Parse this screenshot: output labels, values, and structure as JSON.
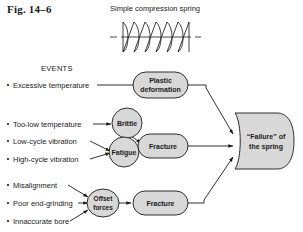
{
  "figure": {
    "number_label": "Fig. 14–6",
    "spring_title": "Simple compression spring",
    "events_heading": "EVENTS"
  },
  "colors": {
    "shape_fill": "#d8d8d8",
    "stroke": "#1a1a1a",
    "background": "#ffffff"
  },
  "events": [
    {
      "label": "Excessive temperature"
    },
    {
      "label": "Too-low temperature"
    },
    {
      "label": "Low-cycle vibration"
    },
    {
      "label": "High-cycle vibration"
    },
    {
      "label": "Misalignment"
    },
    {
      "label": "Poor end-grinding"
    },
    {
      "label": "Innaccurate bore"
    }
  ],
  "nodes": {
    "plastic_deformation": {
      "line1": "Plastic",
      "line2": "deformation"
    },
    "brittle": {
      "label": "Brittle"
    },
    "fatigue": {
      "label": "Fatigue"
    },
    "fracture_upper": {
      "label": "Fracture"
    },
    "offset_forces": {
      "line1": "Offset",
      "line2": "forces"
    },
    "fracture_lower": {
      "label": "Fracture"
    }
  },
  "outcome": {
    "line1": "“Failure” of",
    "line2": "the spring"
  },
  "icons": {
    "spring": "coil-spring-icon",
    "centerline": "center-line-icon",
    "bullet": "bullet-dot-icon",
    "arrow": "arrowhead-icon"
  }
}
